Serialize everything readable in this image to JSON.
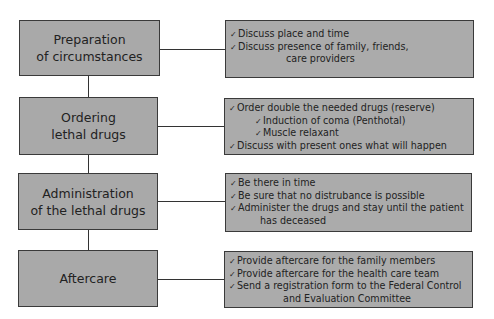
{
  "diagram": {
    "title_fragment": "'",
    "check_icon": "✓",
    "stages": [
      {
        "id": "preparation",
        "label_lines": [
          "Preparation",
          "of circumstances"
        ],
        "items": [
          {
            "level": 1,
            "text": "Discuss place and time"
          },
          {
            "level": 1,
            "text": "Discuss presence of family, friends,",
            "continuation": "care providers"
          }
        ]
      },
      {
        "id": "ordering",
        "label_lines": [
          "Ordering",
          "lethal drugs"
        ],
        "items": [
          {
            "level": 1,
            "text": "Order double the needed drugs (reserve)"
          },
          {
            "level": 2,
            "text": "Induction of coma (Penthotal)"
          },
          {
            "level": 2,
            "text": "Muscle relaxant"
          },
          {
            "level": 1,
            "text": "Discuss with present ones what will happen"
          }
        ]
      },
      {
        "id": "administration",
        "label_lines": [
          "Administration",
          "of the lethal drugs"
        ],
        "items": [
          {
            "level": 1,
            "text": "Be there in time"
          },
          {
            "level": 1,
            "text": "Be sure that no distrubance is possible"
          },
          {
            "level": 1,
            "text": "Administer the drugs and stay until the patient",
            "continuation": "has deceased"
          }
        ]
      },
      {
        "id": "aftercare",
        "label_lines": [
          "Aftercare"
        ],
        "items": [
          {
            "level": 1,
            "text": "Provide aftercare for the family members"
          },
          {
            "level": 1,
            "text": "Provide aftercare for the health care team"
          },
          {
            "level": 1,
            "text": "Send a registration form to the Federal Control",
            "continuation": "and Evaluation Committee"
          }
        ]
      }
    ],
    "colors": {
      "box_fill": "#a9a9a9",
      "border": "#3a3a3a",
      "connector": "#333333",
      "background": "#ffffff"
    }
  }
}
